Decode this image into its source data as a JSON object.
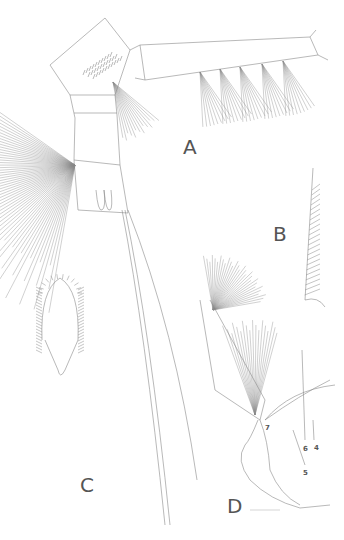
{
  "figure": {
    "panels": [
      {
        "id": "A",
        "label": "A",
        "x": 183,
        "y": 137
      },
      {
        "id": "B",
        "label": "B",
        "x": 273,
        "y": 224
      },
      {
        "id": "C",
        "label": "C",
        "x": 80,
        "y": 475
      },
      {
        "id": "D",
        "label": "D",
        "x": 227,
        "y": 496
      }
    ],
    "numbers": [
      {
        "text": "7",
        "x": 265,
        "y": 425
      },
      {
        "text": "6",
        "x": 303,
        "y": 446
      },
      {
        "text": "4",
        "x": 314,
        "y": 445
      },
      {
        "text": "5",
        "x": 303,
        "y": 470
      }
    ],
    "line_color": "#888888",
    "label_color": "#555555"
  }
}
